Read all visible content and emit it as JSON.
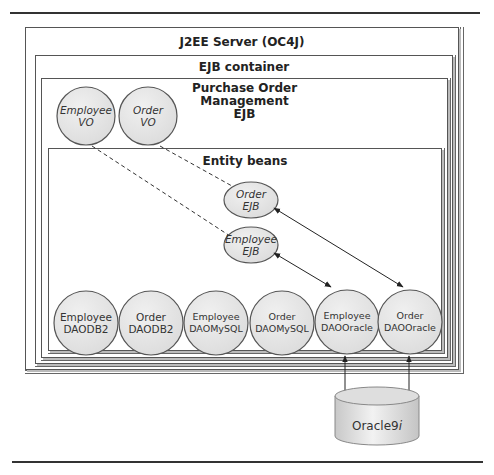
{
  "diagram": {
    "containers": {
      "server": {
        "title": "J2EE Server (OC4J)"
      },
      "ejb_container": {
        "title": "EJB container"
      },
      "po_management": {
        "title_lines": [
          "Purchase Order",
          "Management",
          "EJB"
        ]
      },
      "entity_beans": {
        "title": "Entity beans"
      }
    },
    "value_objects": [
      {
        "line1": "Employee",
        "line2": "VO"
      },
      {
        "line1": "Order",
        "line2": "VO"
      }
    ],
    "entity_ejbs": [
      {
        "line1": "Order",
        "line2": "EJB"
      },
      {
        "line1": "Employee",
        "line2": "EJB"
      }
    ],
    "daos": [
      {
        "line1": "Employee",
        "line2": "DAODB2"
      },
      {
        "line1": "Order",
        "line2": "DAODB2"
      },
      {
        "line1": "Employee",
        "line2": "DAOMySQL"
      },
      {
        "line1": "Order",
        "line2": "DAOMySQL"
      },
      {
        "line1": "Employee",
        "line2": "DAOOracle"
      },
      {
        "line1": "Order",
        "line2": "DAOOracle"
      }
    ],
    "database": {
      "label": "Oracle9",
      "suffix": "i"
    },
    "connections": [
      {
        "from": "Employee VO",
        "to": "Employee EJB",
        "style": "dashed"
      },
      {
        "from": "Order VO",
        "to": "Order EJB",
        "style": "dashed"
      },
      {
        "from": "Employee EJB",
        "to": "Employee DAOOracle",
        "style": "bidirectional-arrow"
      },
      {
        "from": "Order EJB",
        "to": "Order DAOOracle",
        "style": "bidirectional-arrow"
      },
      {
        "from": "Employee DAOOracle",
        "to": "Oracle9i",
        "style": "bidirectional-arrow"
      },
      {
        "from": "Order DAOOracle",
        "to": "Oracle9i",
        "style": "bidirectional-arrow"
      }
    ],
    "colors": {
      "node_fill": "#e6e6e6",
      "node_stroke": "#555555",
      "line": "#222222",
      "box_border": "#555555"
    }
  }
}
